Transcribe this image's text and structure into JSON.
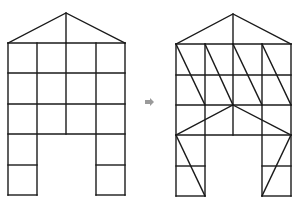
{
  "diagram": {
    "type": "structural-frame-transformation",
    "description": "House-shaped rectangular frame grid transformed into a triangulated (braced) frame",
    "stroke_color": "#1a1a1a",
    "arrow_color": "#9a9a9a",
    "arrow_glyph": "right-arrow",
    "before": {
      "label": "",
      "roof_apex": [
        66,
        13
      ],
      "columns_x": [
        8,
        37,
        66,
        96,
        125
      ],
      "floors_y": [
        43,
        73,
        104,
        134,
        165,
        195
      ],
      "bracing": "none"
    },
    "after": {
      "label": "",
      "roof_apex": [
        233,
        14
      ],
      "columns_x": [
        176,
        205,
        233,
        262,
        291
      ],
      "floors_y": [
        44,
        75,
        105,
        135,
        166,
        196
      ],
      "bracing": [
        "diagonals in top two storeys from top-left to bottom-right in each bay",
        "inverted-V from center node (233,105) to outer corners (176,135) and (291,135)",
        "diagonal braces in both leg towers"
      ]
    }
  }
}
